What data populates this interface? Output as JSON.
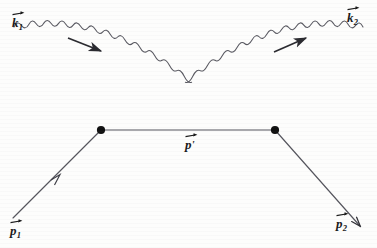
{
  "figure": {
    "kind": "feynman-diagram",
    "background_color": "#fdfdfc",
    "line_color": "#4a4a52",
    "electron_line_color": "#55555d",
    "vertex_color": "#111111",
    "label_color": "#1a1a1a",
    "width": 377,
    "height": 248
  },
  "labels": {
    "photon_in": {
      "base": "k",
      "sub": "1",
      "prime": "",
      "vector": true
    },
    "photon_out": {
      "base": "k",
      "sub": "2",
      "prime": "",
      "vector": true
    },
    "electron_in": {
      "base": "p",
      "sub": "1",
      "prime": "",
      "vector": true
    },
    "electron_out": {
      "base": "p",
      "sub": "2",
      "prime": "",
      "vector": true
    },
    "electron_internal": {
      "base": "p",
      "sub": "",
      "prime": "'",
      "vector": true
    }
  },
  "elements": {
    "photon_in_line": "incoming-photon-wavy-line",
    "photon_out_line": "outgoing-photon-wavy-line",
    "electron_in_line": "incoming-electron-line",
    "electron_out_line": "outgoing-electron-line",
    "electron_internal_line": "internal-electron-propagator",
    "left_vertex": "interaction-vertex-left",
    "right_vertex": "interaction-vertex-right",
    "photon_in_arrow": "photon-in-momentum-arrow",
    "photon_out_arrow": "photon-out-momentum-arrow",
    "electron_in_arrow": "electron-in-momentum-arrow",
    "electron_out_arrow": "electron-out-momentum-arrow"
  }
}
